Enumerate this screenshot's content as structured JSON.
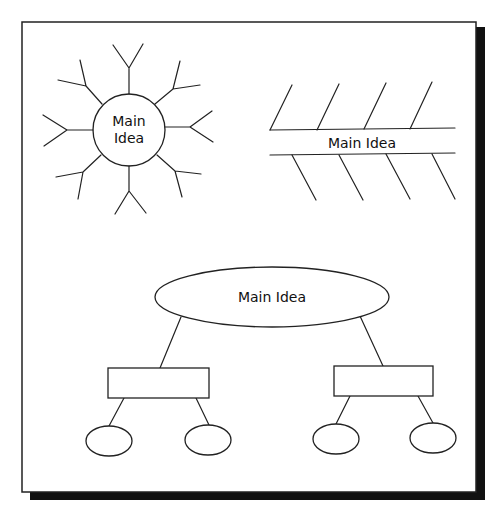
{
  "diagram": {
    "colors": {
      "stroke": "#222222",
      "shadow": "#111111",
      "background": "#ffffff"
    },
    "sunburst": {
      "label_line1": "Main",
      "label_line2": "Idea",
      "spokes": 8
    },
    "fishbone": {
      "label": "Main Idea",
      "upper_bones": 4,
      "lower_bones": 4
    },
    "tree": {
      "root_label": "Main Idea",
      "branches": [
        {
          "label": "",
          "children": [
            "",
            ""
          ]
        },
        {
          "label": "",
          "children": [
            "",
            ""
          ]
        }
      ]
    }
  }
}
